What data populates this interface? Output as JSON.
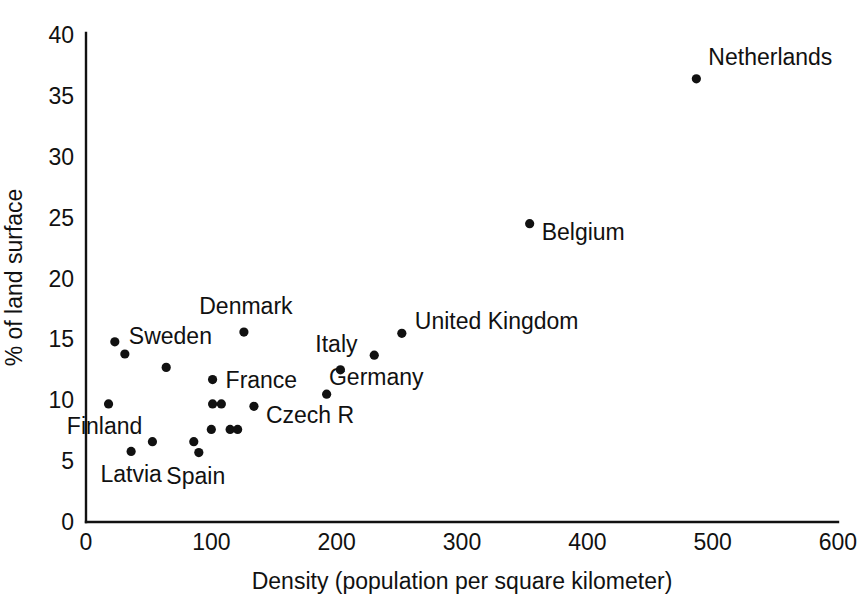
{
  "chart_data": {
    "type": "scatter",
    "title": "",
    "xlabel": "Density (population per square kilometer)",
    "ylabel": "% of land surface",
    "xlim": [
      0,
      600
    ],
    "ylim": [
      0,
      40
    ],
    "xticks": [
      "0",
      "100",
      "200",
      "300",
      "400",
      "500",
      "600"
    ],
    "xtick_values": [
      0,
      100,
      200,
      300,
      400,
      500,
      600
    ],
    "yticks": [
      "0",
      "5",
      "10",
      "15",
      "20",
      "25",
      "30",
      "35",
      "40"
    ],
    "ytick_values": [
      0,
      5,
      10,
      15,
      20,
      25,
      30,
      35,
      40
    ],
    "grid": false,
    "legend": "none",
    "marker": "filled-circle",
    "marker_color": "#111111",
    "points": [
      {
        "label": "Netherlands",
        "x": 487,
        "y": 36.4,
        "label_dx": 12,
        "label_dy": -14,
        "anchor": "start"
      },
      {
        "label": "Belgium",
        "x": 354,
        "y": 24.5,
        "label_dx": 12,
        "label_dy": 16,
        "anchor": "start"
      },
      {
        "label": "United Kingdom",
        "x": 252,
        "y": 15.5,
        "label_dx": 13,
        "label_dy": -4,
        "anchor": "start"
      },
      {
        "label": "Denmark",
        "x": 126,
        "y": 15.6,
        "label_dx": 2,
        "label_dy": -18,
        "anchor": "middle"
      },
      {
        "label": "Sweden",
        "x": 23,
        "y": 14.8,
        "label_dx": 14,
        "label_dy": 2,
        "anchor": "start"
      },
      {
        "label": "",
        "x": 31,
        "y": 13.8,
        "label_dx": 0,
        "label_dy": 0,
        "anchor": "start"
      },
      {
        "label": "Germany",
        "x": 230,
        "y": 13.7,
        "label_dx": 2,
        "label_dy": 30,
        "anchor": "middle"
      },
      {
        "label": "Italy",
        "x": 203,
        "y": 12.5,
        "label_dx": -4,
        "label_dy": -18,
        "anchor": "middle"
      },
      {
        "label": "",
        "x": 64,
        "y": 12.7,
        "label_dx": 0,
        "label_dy": 0,
        "anchor": "start"
      },
      {
        "label": "France",
        "x": 101,
        "y": 11.7,
        "label_dx": 13,
        "label_dy": 8,
        "anchor": "start"
      },
      {
        "label": "",
        "x": 192,
        "y": 10.5,
        "label_dx": 0,
        "label_dy": 0,
        "anchor": "start"
      },
      {
        "label": "Finland",
        "x": 18,
        "y": 9.7,
        "label_dx": -4,
        "label_dy": 30,
        "anchor": "middle"
      },
      {
        "label": "",
        "x": 101,
        "y": 9.7,
        "label_dx": 0,
        "label_dy": 0,
        "anchor": "start"
      },
      {
        "label": "",
        "x": 108,
        "y": 9.7,
        "label_dx": 0,
        "label_dy": 0,
        "anchor": "start"
      },
      {
        "label": "Czech R",
        "x": 134,
        "y": 9.5,
        "label_dx": 12,
        "label_dy": 17,
        "anchor": "start"
      },
      {
        "label": "",
        "x": 100,
        "y": 7.6,
        "label_dx": 0,
        "label_dy": 0,
        "anchor": "start"
      },
      {
        "label": "",
        "x": 115,
        "y": 7.6,
        "label_dx": 0,
        "label_dy": 0,
        "anchor": "start"
      },
      {
        "label": "",
        "x": 121,
        "y": 7.6,
        "label_dx": 0,
        "label_dy": 0,
        "anchor": "start"
      },
      {
        "label": "",
        "x": 53,
        "y": 6.6,
        "label_dx": 0,
        "label_dy": 0,
        "anchor": "start"
      },
      {
        "label": "Spain",
        "x": 86,
        "y": 6.6,
        "label_dx": 2,
        "label_dy": 42,
        "anchor": "middle"
      },
      {
        "label": "Latvia",
        "x": 36,
        "y": 5.8,
        "label_dx": 0,
        "label_dy": 31,
        "anchor": "middle"
      },
      {
        "label": "",
        "x": 90,
        "y": 5.7,
        "label_dx": 0,
        "label_dy": 0,
        "anchor": "start"
      }
    ]
  },
  "geometry": {
    "origin_x": 86,
    "origin_y": 522,
    "px_per_x": 1.2533,
    "px_per_y": 12.175,
    "axis_top_y": 33,
    "axis_right_x": 838,
    "dot_radius": 4.6,
    "x_title_y": 589,
    "y_title_x": 22
  }
}
